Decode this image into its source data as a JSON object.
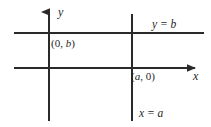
{
  "figure": {
    "type": "coordinate-axes-diagram",
    "background_color": "#ffffff",
    "line_color": "#2a2a2a",
    "text_color": "#1f1f1f",
    "axes": {
      "x_axis_label": "x",
      "y_axis_label": "y"
    },
    "lines": [
      {
        "name": "horizontal-line-y-equals-b",
        "label": "y = b"
      },
      {
        "name": "vertical-line-x-equals-a",
        "label": "x = a"
      }
    ],
    "points": [
      {
        "name": "y-intercept",
        "label": "(0, b)",
        "coord_x": "0",
        "coord_y": "b"
      },
      {
        "name": "x-intercept",
        "label": "(a, 0)",
        "coord_x": "a",
        "coord_y": "0"
      }
    ],
    "labels": {
      "y_axis": "y",
      "x_axis": "x",
      "y_equals_b": "y = b",
      "x_equals_a": "x = a",
      "point_0b_open": "(0, ",
      "point_0b_var": "b",
      "point_0b_close": ")",
      "point_a0_open": "(",
      "point_a0_var": "a",
      "point_a0_close": ", 0)"
    }
  }
}
